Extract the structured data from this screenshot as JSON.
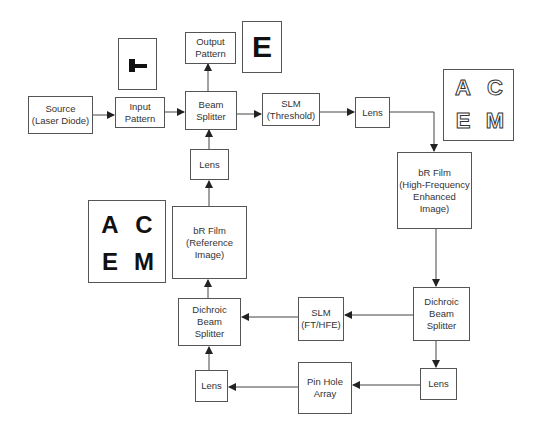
{
  "diagram": {
    "nodes": {
      "source": {
        "lines": [
          "Source",
          "(Laser Diode)"
        ]
      },
      "input_pattern": {
        "lines": [
          "Input",
          "Pattern"
        ]
      },
      "beam_splitter": {
        "lines": [
          "Beam",
          "Splitter"
        ]
      },
      "output_pattern": {
        "lines": [
          "Output",
          "Pattern"
        ]
      },
      "slm_threshold": {
        "lines": [
          "SLM",
          "(Threshold)"
        ]
      },
      "lens_top": {
        "lines": [
          "Lens"
        ]
      },
      "br_film_hfe": {
        "lines": [
          "bR Film",
          "(High-Frequency",
          "Enhanced",
          "Image)"
        ]
      },
      "dichroic_right": {
        "lines": [
          "Dichroic",
          "Beam",
          "Splitter"
        ]
      },
      "slm_ft_hfe": {
        "lines": [
          "SLM",
          "(FT/HFE)"
        ]
      },
      "dichroic_left": {
        "lines": [
          "Dichroic",
          "Beam",
          "Splitter"
        ]
      },
      "lens_bottom_right": {
        "lines": [
          "Lens"
        ]
      },
      "pin_hole_array": {
        "lines": [
          "Pin Hole",
          "Array"
        ]
      },
      "lens_bottom_left": {
        "lines": [
          "Lens"
        ]
      },
      "br_film_ref": {
        "lines": [
          "bR Film",
          "(Reference",
          "Image)"
        ]
      },
      "lens_middle": {
        "lines": [
          "Lens"
        ]
      }
    },
    "images": {
      "output_letter": "E",
      "outline_letters": [
        "A",
        "C",
        "E",
        "M"
      ],
      "reference_letters": [
        "A",
        "C",
        "E",
        "M"
      ]
    },
    "edges": [
      [
        "source",
        "input_pattern"
      ],
      [
        "input_pattern",
        "beam_splitter"
      ],
      [
        "beam_splitter",
        "output_pattern"
      ],
      [
        "beam_splitter",
        "slm_threshold"
      ],
      [
        "slm_threshold",
        "lens_top"
      ],
      [
        "lens_top",
        "br_film_hfe"
      ],
      [
        "br_film_hfe",
        "dichroic_right"
      ],
      [
        "dichroic_right",
        "slm_ft_hfe"
      ],
      [
        "slm_ft_hfe",
        "dichroic_left"
      ],
      [
        "dichroic_right",
        "lens_bottom_right"
      ],
      [
        "lens_bottom_right",
        "pin_hole_array"
      ],
      [
        "pin_hole_array",
        "lens_bottom_left"
      ],
      [
        "lens_bottom_left",
        "dichroic_left"
      ],
      [
        "dichroic_left",
        "br_film_ref"
      ],
      [
        "br_film_ref",
        "lens_middle"
      ],
      [
        "lens_middle",
        "beam_splitter"
      ]
    ]
  }
}
